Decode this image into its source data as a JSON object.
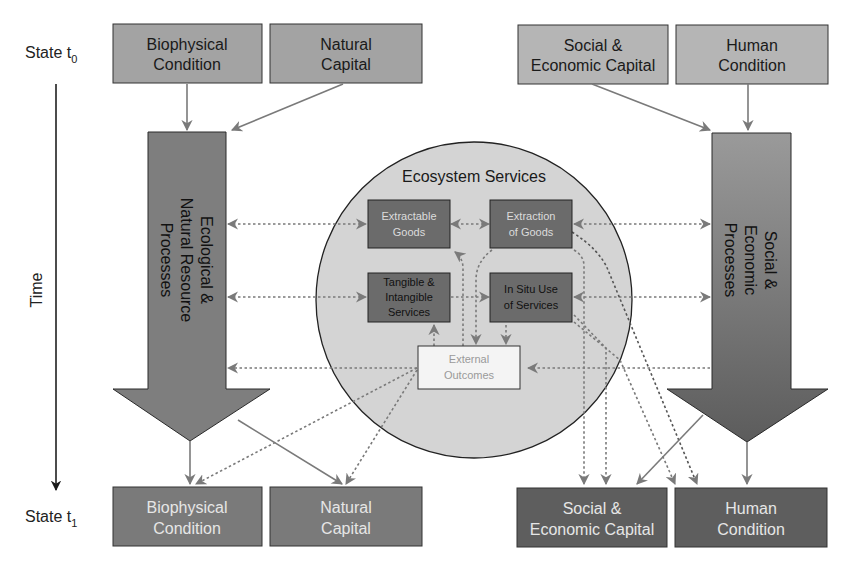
{
  "time_axis": {
    "label": "Time",
    "state_t0": {
      "prefix": "State t",
      "sub": "0"
    },
    "state_t1": {
      "prefix": "State t",
      "sub": "1"
    }
  },
  "top_row": {
    "biophysical": [
      "Biophysical",
      "Condition"
    ],
    "natural": [
      "Natural",
      "Capital"
    ],
    "social": [
      "Social &",
      "Economic Capital"
    ],
    "human": [
      "Human",
      "Condition"
    ]
  },
  "bottom_row": {
    "biophysical": [
      "Biophysical",
      "Condition"
    ],
    "natural": [
      "Natural",
      "Capital"
    ],
    "social": [
      "Social &",
      "Economic Capital"
    ],
    "human": [
      "Human",
      "Condition"
    ]
  },
  "left_process": [
    "Ecological &",
    "Natural Resource",
    "Processes"
  ],
  "right_process": [
    "Social &",
    "Economic",
    "Processes"
  ],
  "ecosystem": {
    "title": "Ecosystem Services",
    "extractable": [
      "Extractable",
      "Goods"
    ],
    "extraction": [
      "Extraction",
      "of Goods"
    ],
    "tangible": [
      "Tangible &",
      "Intangible",
      "Services"
    ],
    "insitu": [
      "In Situ Use",
      "of Services"
    ],
    "external": [
      "External",
      "Outcomes"
    ]
  },
  "colors": {
    "top_box": "#a3a3a3",
    "bottom_box": "#6e6e6e",
    "inner_box": "#6b6b6b",
    "circle": "#d4d4d4",
    "arrow_left": "#7e7e7e",
    "connector": "#8a8a8a"
  }
}
